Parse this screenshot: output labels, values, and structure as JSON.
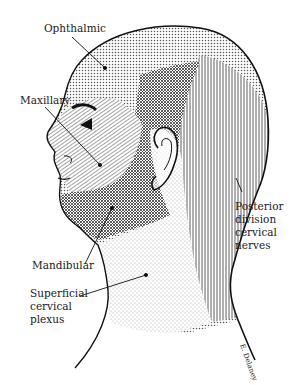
{
  "figure": {
    "regions": [
      {
        "id": "ophthalmic",
        "label": "Ophthalmic",
        "pattern": "fine-dots"
      },
      {
        "id": "maxillary",
        "label": "Maxillary",
        "pattern": "diagonal-lines"
      },
      {
        "id": "mandibular",
        "label": "Mandibular",
        "pattern": "crosshatch"
      },
      {
        "id": "superficial-cervical-plexus",
        "label": "Superficial\ncervical\nplexus",
        "pattern": "light-stipple"
      },
      {
        "id": "posterior-division-cervical-nerves",
        "label": "Posterior\ndivision\ncervical\nnerves",
        "pattern": "vertical-lines"
      }
    ],
    "signature": "E. Delaney",
    "colors": {
      "ink": "#1a1a1a",
      "background": "#ffffff"
    }
  },
  "labels": {
    "ophthalmic": "Ophthalmic",
    "maxillary": "Maxillary",
    "mandibular": "Mandibular",
    "superficial": "Superficial\ncervical\nplexus",
    "posterior": "Posterior\ndivision\ncervical\nnerves"
  }
}
